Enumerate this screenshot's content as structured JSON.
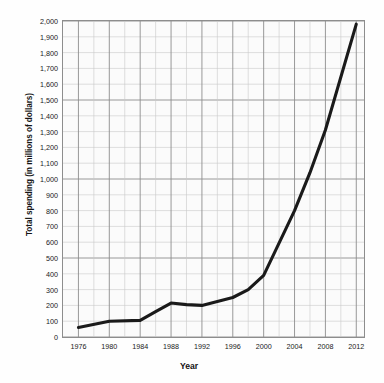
{
  "chart_data": {
    "type": "line",
    "title": "",
    "xlabel": "Year",
    "ylabel": "Total spending (in millions of dollars)",
    "xlim": [
      1974,
      2013
    ],
    "ylim": [
      0,
      2000
    ],
    "grid": true,
    "legend": "none",
    "y_ticks": [
      "0",
      "100",
      "200",
      "300",
      "400",
      "500",
      "600",
      "700",
      "800",
      "900",
      "1,000",
      "1,100",
      "1,200",
      "1,300",
      "1,400",
      "1,500",
      "1,600",
      "1,700",
      "1,800",
      "1,900",
      "2,000"
    ],
    "y_tick_values": [
      0,
      100,
      200,
      300,
      400,
      500,
      600,
      700,
      800,
      900,
      1000,
      1100,
      1200,
      1300,
      1400,
      1500,
      1600,
      1700,
      1800,
      1900,
      2000
    ],
    "x_ticks": [
      "1976",
      "1980",
      "1984",
      "1988",
      "1992",
      "1996",
      "2000",
      "2004",
      "2008",
      "2012"
    ],
    "x_tick_values": [
      1976,
      1980,
      1984,
      1988,
      1992,
      1996,
      2000,
      2004,
      2008,
      2012
    ],
    "x": [
      1976,
      1980,
      1984,
      1986,
      1988,
      1990,
      1992,
      1996,
      1998,
      2000,
      2004,
      2006,
      2008,
      2012
    ],
    "values": [
      60,
      100,
      105,
      160,
      215,
      205,
      200,
      250,
      300,
      390,
      800,
      1040,
      1310,
      1980
    ],
    "series": [
      {
        "name": "Total spending",
        "color": "#1a1a1a",
        "x": [
          1976,
          1980,
          1984,
          1986,
          1988,
          1990,
          1992,
          1996,
          1998,
          2000,
          2004,
          2006,
          2008,
          2012
        ],
        "values": [
          60,
          100,
          105,
          160,
          215,
          205,
          200,
          250,
          300,
          390,
          800,
          1040,
          1310,
          1980
        ]
      }
    ],
    "colors": {
      "line": "#1a1a1a",
      "grid_minor": "#c9c9c9",
      "grid_major": "#8d8d8d",
      "plot_background": "#fbfbfb",
      "axis_border": "#8d8d8d",
      "text": "#141414"
    }
  }
}
